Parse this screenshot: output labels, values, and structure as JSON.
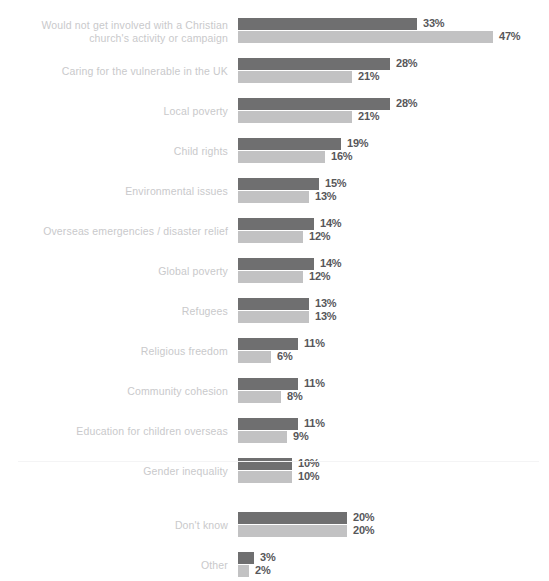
{
  "top_note": "",
  "colors": {
    "series_1": "#6f6f70",
    "series_2": "#c2c2c3",
    "label_text": "#c9c9cb",
    "value_text": "#57575a",
    "background": "#ffffff",
    "separator": "#f4f4f5"
  },
  "chart_data": {
    "type": "bar",
    "orientation": "horizontal",
    "title": "",
    "xlabel": "",
    "ylabel": "",
    "xlim": [
      0,
      47
    ],
    "grid": false,
    "legend": "none",
    "value_suffix": "%",
    "categories": [
      "Would not get involved with a Christian church's activity or campaign",
      "Caring for the vulnerable in the UK",
      "Local poverty",
      "Child rights",
      "Environmental issues",
      "Overseas emergencies / disaster relief",
      "Global poverty",
      "Refugees",
      "Religious freedom",
      "Community cohesion",
      "Education for children overseas",
      "Gender inequality",
      "Don't know",
      "Other"
    ],
    "series": [
      {
        "name": "series-1",
        "color": "#6f6f70",
        "values": [
          33,
          28,
          28,
          19,
          15,
          14,
          14,
          13,
          11,
          11,
          11,
          10,
          20,
          3
        ]
      },
      {
        "name": "series-2",
        "color": "#c2c2c3",
        "values": [
          47,
          21,
          21,
          16,
          13,
          12,
          12,
          13,
          6,
          8,
          9,
          10,
          20,
          2
        ]
      }
    ]
  },
  "rows": [
    {
      "label_lines": [
        "Would not get involved with a Christian",
        "church's activity or campaign"
      ],
      "v1": 33,
      "v2": 47,
      "v1_text": "33%",
      "v2_text": "47%",
      "gap_before": false
    },
    {
      "label_lines": [
        "Caring for the vulnerable in the UK"
      ],
      "v1": 28,
      "v2": 21,
      "v1_text": "28%",
      "v2_text": "21%",
      "gap_before": false
    },
    {
      "label_lines": [
        "Local poverty"
      ],
      "v1": 28,
      "v2": 21,
      "v1_text": "28%",
      "v2_text": "21%",
      "gap_before": false
    },
    {
      "label_lines": [
        "Child rights"
      ],
      "v1": 19,
      "v2": 16,
      "v1_text": "19%",
      "v2_text": "16%",
      "gap_before": false
    },
    {
      "label_lines": [
        "Environmental issues"
      ],
      "v1": 15,
      "v2": 13,
      "v1_text": "15%",
      "v2_text": "13%",
      "gap_before": false
    },
    {
      "label_lines": [
        "Overseas emergencies / disaster relief"
      ],
      "v1": 14,
      "v2": 12,
      "v1_text": "14%",
      "v2_text": "12%",
      "gap_before": false
    },
    {
      "label_lines": [
        "Global poverty"
      ],
      "v1": 14,
      "v2": 12,
      "v1_text": "14%",
      "v2_text": "12%",
      "gap_before": false
    },
    {
      "label_lines": [
        "Refugees"
      ],
      "v1": 13,
      "v2": 13,
      "v1_text": "13%",
      "v2_text": "13%",
      "gap_before": false
    },
    {
      "label_lines": [
        "Religious freedom"
      ],
      "v1": 11,
      "v2": 6,
      "v1_text": "11%",
      "v2_text": "6%",
      "gap_before": false
    },
    {
      "label_lines": [
        "Community cohesion"
      ],
      "v1": 11,
      "v2": 8,
      "v1_text": "11%",
      "v2_text": "8%",
      "gap_before": false
    },
    {
      "label_lines": [
        "Education for children overseas"
      ],
      "v1": 11,
      "v2": 9,
      "v1_text": "11%",
      "v2_text": "9%",
      "gap_before": false
    },
    {
      "label_lines": [
        "Gender inequality"
      ],
      "v1": 10,
      "v2": 10,
      "v1_text": "10%",
      "v2_text": "10%",
      "gap_before": false
    },
    {
      "label_lines": [
        "Don't know"
      ],
      "v1": 20,
      "v2": 20,
      "v1_text": "20%",
      "v2_text": "20%",
      "gap_before": true
    },
    {
      "label_lines": [
        "Other"
      ],
      "v1": 3,
      "v2": 2,
      "v1_text": "3%",
      "v2_text": "2%",
      "gap_before": false
    }
  ]
}
